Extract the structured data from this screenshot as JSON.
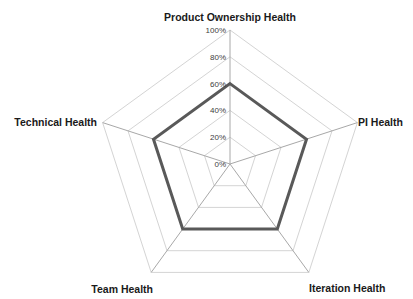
{
  "chart_data": {
    "type": "radar",
    "title": "",
    "categories": [
      "Product Ownership Health",
      "PI Health",
      "Iteration Health",
      "Team Health",
      "Technical Health"
    ],
    "series": [
      {
        "name": "Health",
        "values": [
          60,
          60,
          60,
          60,
          60
        ],
        "color": "#595959"
      }
    ],
    "r_ticks": [
      "0%",
      "20%",
      "40%",
      "60%",
      "80%",
      "100%"
    ],
    "rlim": [
      0,
      100
    ],
    "grid": true,
    "legend": "none"
  }
}
